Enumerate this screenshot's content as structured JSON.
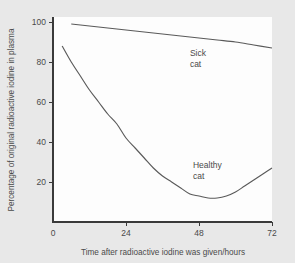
{
  "chart_data": {
    "type": "line",
    "title": "",
    "xlabel": "Time after radioactive iodine was given/hours",
    "ylabel": "Percentage of original radioactive iodine in plasma",
    "xlim": [
      0,
      72
    ],
    "ylim": [
      0,
      105
    ],
    "xticks": [
      0,
      24,
      48,
      72
    ],
    "xtick_labels": [
      "0",
      "24",
      "48",
      "72"
    ],
    "yticks": [
      20,
      40,
      60,
      80,
      100
    ],
    "ytick_labels": [
      "20",
      "40",
      "60",
      "80",
      "100"
    ],
    "grid": false,
    "legend_position": "inline-annotations",
    "line_color": "#5a5a5a",
    "axis_color": "#3a3a3a",
    "plot_background": "#fdfdfd",
    "figure_background": "#e8e8e8",
    "series": [
      {
        "name": "Sick cat",
        "label_line_1": "Sick",
        "label_line_2": "cat",
        "label_x": 45,
        "label_y": 83,
        "x": [
          6,
          12,
          18,
          24,
          30,
          36,
          42,
          48,
          54,
          60,
          66,
          72
        ],
        "values": [
          99,
          98,
          97,
          96,
          95,
          94,
          93,
          92,
          91,
          90,
          88.5,
          87
        ]
      },
      {
        "name": "Healthy cat",
        "label_line_1": "Healthy",
        "label_line_2": "cat",
        "label_x": 46,
        "label_y": 27,
        "x": [
          3,
          6,
          9,
          12,
          15,
          18,
          21,
          24,
          27,
          30,
          33,
          36,
          39,
          42,
          45,
          48,
          51,
          54,
          57,
          60,
          63,
          66,
          69,
          72
        ],
        "values": [
          88,
          80,
          73,
          66,
          60,
          54,
          49,
          42,
          37,
          32,
          27,
          23,
          20,
          17,
          14,
          13,
          12,
          12,
          13,
          15,
          18,
          21,
          24,
          27
        ]
      }
    ]
  }
}
